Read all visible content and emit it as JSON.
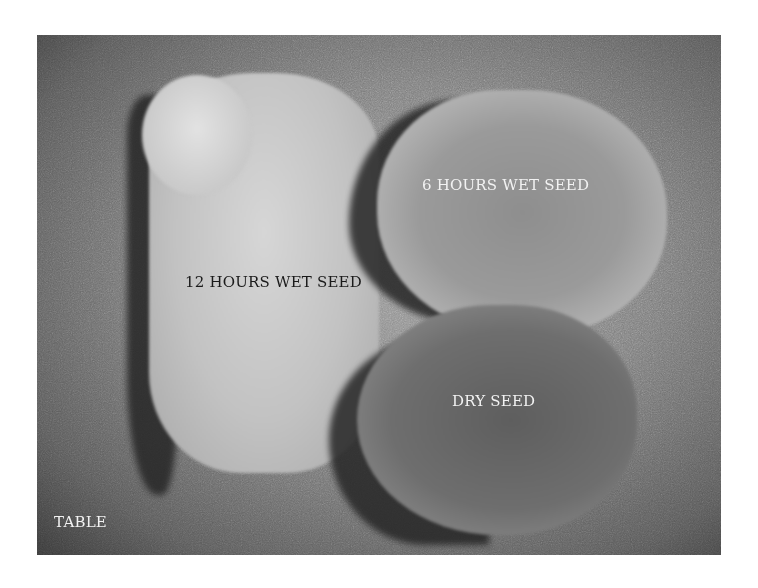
{
  "image": {
    "description": "Grayscale photograph of three seeds on a table at different hydration stages",
    "labels": {
      "twelve_hours": "12 HOURS WET SEED",
      "six_hours": "6 HOURS WET SEED",
      "dry": "DRY SEED",
      "table": "TABLE"
    }
  }
}
